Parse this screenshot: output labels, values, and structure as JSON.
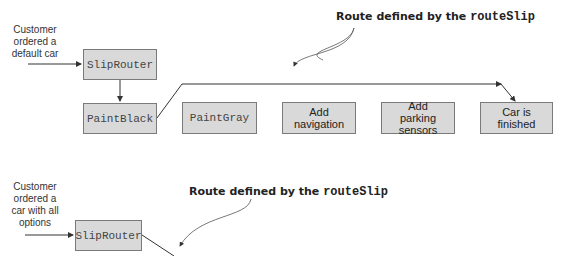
{
  "top_scenario": {
    "input_note": [
      "Customer",
      "ordered a",
      "default car"
    ],
    "callout_prefix": "Route defined by the ",
    "callout_code": "routeSlip",
    "router": "SlipRouter",
    "steps": [
      {
        "label": "PaintBlack",
        "mono": true
      },
      {
        "label": "PaintGray",
        "mono": true
      },
      {
        "label": "Add navigation",
        "mono": false
      },
      {
        "label": "Add parking sensors",
        "mono": false
      },
      {
        "label": "Car is finished",
        "mono": false
      }
    ]
  },
  "bottom_scenario": {
    "input_note": [
      "Customer",
      "ordered a",
      "car with all",
      "options"
    ],
    "callout_prefix": "Route defined by the ",
    "callout_code": "routeSlip",
    "router": "SlipRouter"
  },
  "colors": {
    "box_fill": "#d9d9d9",
    "box_border": "#7a7a7a",
    "line": "#333333"
  }
}
